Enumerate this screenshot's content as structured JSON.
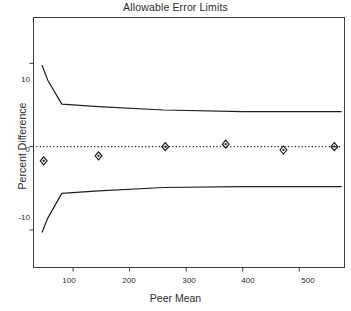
{
  "chart_data": {
    "type": "line",
    "title": "Allowable Error Limits",
    "xlabel": "Peer Mean",
    "ylabel": "Percent Difference",
    "xlim": [
      30,
      580
    ],
    "ylim": [
      -14.5,
      15.5
    ],
    "grid": false,
    "legend": "none",
    "xticks": [
      100,
      200,
      300,
      400,
      500
    ],
    "yticks": [
      10,
      0,
      -10
    ],
    "xtick_labels": [
      "100",
      "200",
      "300",
      "400",
      "500"
    ],
    "ytick_labels": [
      "10",
      "0",
      "-10"
    ],
    "series": [
      {
        "name": "Upper allowable error limit",
        "style": "solid",
        "x": [
          45,
          55,
          80,
          145,
          260,
          400,
          575
        ],
        "values": [
          9.8,
          8.0,
          5.1,
          4.8,
          4.4,
          4.2,
          4.2
        ]
      },
      {
        "name": "Lower allowable error limit",
        "style": "solid",
        "x": [
          45,
          55,
          80,
          145,
          260,
          400,
          575
        ],
        "values": [
          -10.3,
          -8.6,
          -5.6,
          -5.3,
          -4.9,
          -4.8,
          -4.8
        ]
      },
      {
        "name": "Zero reference line",
        "style": "dotted",
        "x": [
          35,
          575
        ],
        "values": [
          0,
          0
        ]
      },
      {
        "name": "Observed percent difference",
        "style": "markers",
        "marker": "diamond",
        "x": [
          48,
          145,
          263,
          370,
          472,
          562
        ],
        "values": [
          -1.7,
          -1.1,
          0.0,
          0.3,
          -0.4,
          0.0
        ]
      }
    ]
  }
}
